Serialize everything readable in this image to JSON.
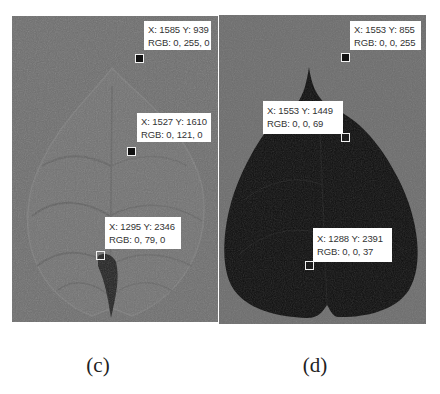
{
  "figure": {
    "panels": [
      {
        "id": "c",
        "caption": "(c)",
        "background": "#6e6e6e",
        "description": "green-channel leaf image with faint venation and dark petiole",
        "points": [
          {
            "x_label": "X: 1585 Y: 939",
            "rgb_label": "RGB: 0, 255, 0"
          },
          {
            "x_label": "X: 1527 Y: 1610",
            "rgb_label": "RGB: 0, 121, 0"
          },
          {
            "x_label": "X: 1295 Y: 2346",
            "rgb_label": "RGB: 0, 79, 0"
          }
        ]
      },
      {
        "id": "d",
        "caption": "(d)",
        "background": "#6c6c6c",
        "description": "blue-channel segmented leaf silhouette (dark)",
        "points": [
          {
            "x_label": "X: 1553 Y: 855",
            "rgb_label": "RGB: 0, 0, 255"
          },
          {
            "x_label": "X: 1553 Y: 1449",
            "rgb_label": "RGB: 0, 0, 69"
          },
          {
            "x_label": "X: 1288 Y: 2391",
            "rgb_label": "RGB: 0, 0, 37"
          }
        ]
      }
    ]
  }
}
